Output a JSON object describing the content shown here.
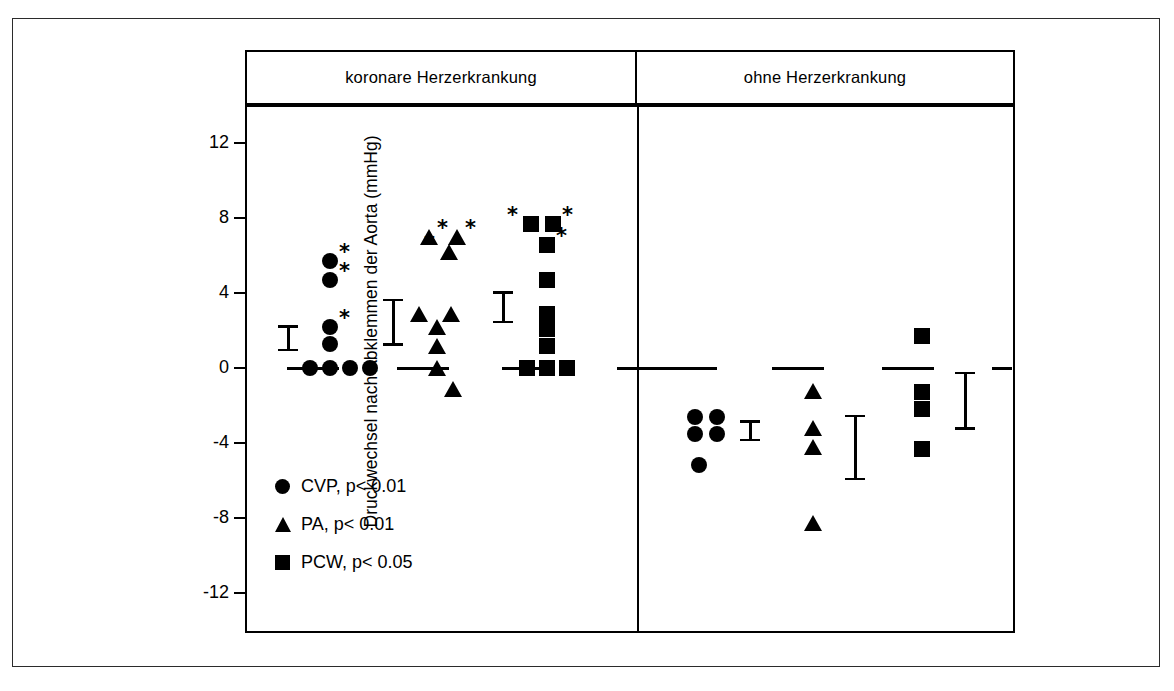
{
  "chart_data": {
    "type": "scatter",
    "title": "",
    "xlabel": "",
    "ylabel": "Druckwechsel nach Abklemmen der Aorta (mmHg)",
    "ylim": [
      -14,
      14
    ],
    "yticks": [
      12,
      8,
      4,
      0,
      -4,
      -8,
      -12
    ],
    "ytick_labels": [
      "12",
      "8",
      "4",
      "0",
      "-4",
      "-8",
      "-12"
    ],
    "grid": false,
    "zero_line": "dashed",
    "legend_position": "inside-lower-left",
    "groups": [
      {
        "key": "koronare",
        "label": "koronare Herzerkrankung"
      },
      {
        "key": "ohne",
        "label": "ohne Herzerkrankung"
      }
    ],
    "legend": [
      {
        "marker": "circle",
        "label": "CVP, p< 0.01"
      },
      {
        "marker": "triangle",
        "label": "PA, p< 0.01"
      },
      {
        "marker": "square",
        "label": "PCW, p< 0.05"
      }
    ],
    "series": [
      {
        "name": "CVP",
        "group": "koronare Herzerkrankung",
        "marker": "circle",
        "values": [
          0,
          0,
          0,
          0,
          1.3,
          2.2,
          4.7,
          5.7
        ],
        "significant_values": [
          2.2,
          4.7,
          5.7
        ],
        "mean_error_bar": {
          "low": 0.9,
          "high": 2.3
        }
      },
      {
        "name": "PA",
        "group": "koronare Herzerkrankung",
        "marker": "triangle",
        "values": [
          -1.1,
          0.0,
          1.2,
          2.2,
          2.9,
          2.9,
          6.2,
          7.0,
          7.0
        ],
        "significant_values": [
          6.2,
          7.0,
          7.0
        ],
        "mean_error_bar": {
          "low": 1.2,
          "high": 3.7
        }
      },
      {
        "name": "PCW",
        "group": "koronare Herzerkrankung",
        "marker": "square",
        "values": [
          0,
          0,
          0,
          1.2,
          2.1,
          2.9,
          4.7,
          6.6,
          7.7,
          7.7
        ],
        "significant_values": [
          6.6,
          7.7,
          7.7
        ],
        "mean_error_bar": {
          "low": 2.4,
          "high": 4.1
        }
      },
      {
        "name": "CVP",
        "group": "ohne Herzerkrankung",
        "marker": "circle",
        "values": [
          -2.6,
          -2.6,
          -3.5,
          -3.5,
          -5.2
        ],
        "significant_values": [],
        "mean_error_bar": {
          "low": -3.9,
          "high": -2.8
        }
      },
      {
        "name": "PA",
        "group": "ohne Herzerkrankung",
        "marker": "triangle",
        "values": [
          -1.2,
          -3.2,
          -4.2,
          -8.3
        ],
        "significant_values": [],
        "mean_error_bar": {
          "low": -6.0,
          "high": -2.5
        }
      },
      {
        "name": "PCW",
        "group": "ohne Herzerkrankung",
        "marker": "square",
        "values": [
          1.7,
          -1.3,
          -2.2,
          -4.3
        ],
        "significant_values": [],
        "mean_error_bar": {
          "low": -3.3,
          "high": -0.2
        }
      }
    ],
    "significance_glyph": "*"
  },
  "colors": {
    "marker": "#000000",
    "axis": "#000000",
    "background": "#ffffff",
    "frame": "#2b2b2b"
  }
}
